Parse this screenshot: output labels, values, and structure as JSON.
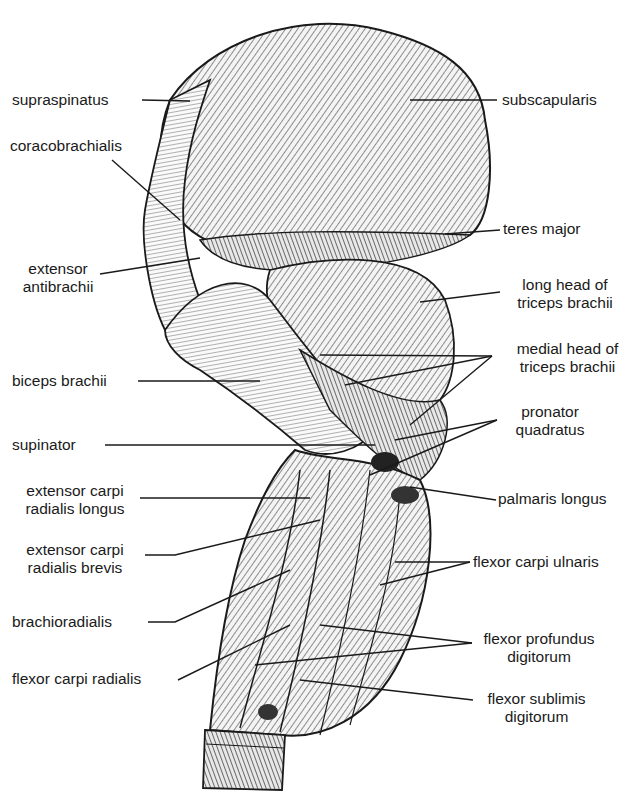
{
  "figure": {
    "colors": {
      "ink": "#1a1a1a",
      "paper": "#ffffff",
      "shade": "#555555"
    }
  },
  "labels_left": [
    {
      "id": "supraspinatus",
      "lines": [
        "supraspinatus"
      ]
    },
    {
      "id": "coracobrachialis",
      "lines": [
        "coracobrachialis"
      ]
    },
    {
      "id": "extensor-antibrachii",
      "lines": [
        "extensor",
        "antibrachii"
      ]
    },
    {
      "id": "biceps-brachii",
      "lines": [
        "biceps brachii"
      ]
    },
    {
      "id": "supinator",
      "lines": [
        "supinator"
      ]
    },
    {
      "id": "extensor-carpi-radialis-longus",
      "lines": [
        "extensor carpi",
        "radialis longus"
      ]
    },
    {
      "id": "extensor-carpi-radialis-brevis",
      "lines": [
        "extensor carpi",
        "radialis brevis"
      ]
    },
    {
      "id": "brachioradialis",
      "lines": [
        "brachioradialis"
      ]
    },
    {
      "id": "flexor-carpi-radialis",
      "lines": [
        "flexor carpi radialis"
      ]
    }
  ],
  "labels_right": [
    {
      "id": "subscapularis",
      "lines": [
        "subscapularis"
      ]
    },
    {
      "id": "teres-major",
      "lines": [
        "teres major"
      ]
    },
    {
      "id": "long-head-triceps",
      "lines": [
        "long head of",
        "triceps brachii"
      ]
    },
    {
      "id": "medial-head-triceps",
      "lines": [
        "medial head of",
        "triceps brachii"
      ]
    },
    {
      "id": "pronator-quadratus",
      "lines": [
        "pronator",
        "quadratus"
      ]
    },
    {
      "id": "palmaris-longus",
      "lines": [
        "palmaris longus"
      ]
    },
    {
      "id": "flexor-carpi-ulnaris",
      "lines": [
        "flexor carpi ulnaris"
      ]
    },
    {
      "id": "flexor-profundus-digitorum",
      "lines": [
        "flexor profundus",
        "digitorum"
      ]
    },
    {
      "id": "flexor-sublimis-digitorum",
      "lines": [
        "flexor sublimis",
        "digitorum"
      ]
    }
  ]
}
